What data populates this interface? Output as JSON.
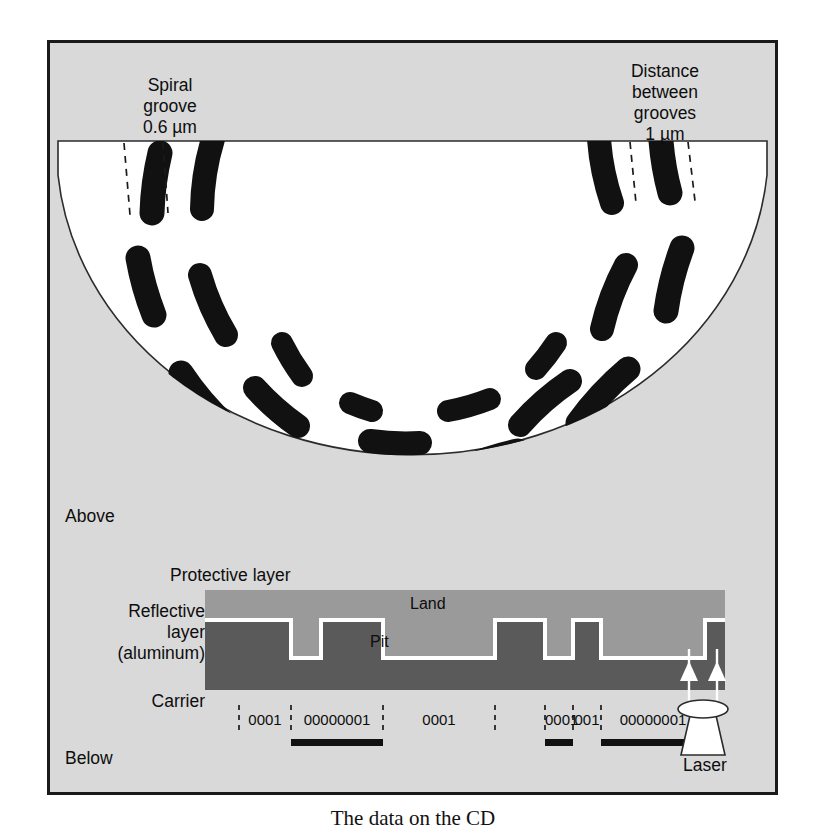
{
  "figure": {
    "caption": "The data on the CD"
  },
  "disc": {
    "label_spiral": "Spiral\ngroove\n0.6 µm",
    "label_distance": "Distance\nbetween\ngrooves\n1 µm",
    "label_above": "Above",
    "label_below": "Below",
    "pit_color": "#111111",
    "surface_color": "#ffffff",
    "background_color": "#d9d9d9"
  },
  "cross_section": {
    "label_protective": "Protective layer",
    "label_reflective": "Reflective\nlayer\n(aluminum)",
    "label_carrier": "Carrier",
    "label_land": "Land",
    "label_pit": "Pit",
    "label_laser": "Laser",
    "protective_color": "#9a9a9a",
    "reflective_color": "#5a5a5a",
    "outline_color": "#ffffff"
  },
  "binary": {
    "segments": [
      {
        "text": "0001",
        "is_pit": false
      },
      {
        "text": "00000001",
        "is_pit": true
      },
      {
        "text": "0001",
        "is_pit": false
      },
      {
        "text": "0001",
        "is_pit": true
      },
      {
        "text": "001",
        "is_pit": false
      },
      {
        "text": "00000001",
        "is_pit": true
      }
    ]
  }
}
